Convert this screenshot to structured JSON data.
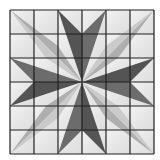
{
  "figure": {
    "grid": {
      "rows": 6,
      "cols": 6,
      "origin": [
        10,
        10
      ],
      "cell_size": 24
    },
    "colors": {
      "background": "#ffffff",
      "cell_fill": "#e6e6e6",
      "cell_fill_light": "#f0f0f0",
      "grid_line": "#202020",
      "cardinal_dark": "#545454",
      "cardinal_mid": "#6c6c6c",
      "diagonal_mid": "#a4a4a4",
      "diagonal_light": "#c6c6c6"
    },
    "cardinal_arms": [
      {
        "name": "top",
        "a": [
          [
            58,
            10
          ],
          [
            82,
            34
          ],
          [
            82,
            82
          ]
        ],
        "b": [
          [
            106,
            10
          ],
          [
            82,
            34
          ],
          [
            82,
            82
          ]
        ]
      },
      {
        "name": "right",
        "a": [
          [
            154,
            58
          ],
          [
            130,
            82
          ],
          [
            82,
            82
          ]
        ],
        "b": [
          [
            154,
            106
          ],
          [
            130,
            82
          ],
          [
            82,
            82
          ]
        ]
      },
      {
        "name": "bottom",
        "a": [
          [
            106,
            154
          ],
          [
            82,
            130
          ],
          [
            82,
            82
          ]
        ],
        "b": [
          [
            58,
            154
          ],
          [
            82,
            130
          ],
          [
            82,
            82
          ]
        ]
      },
      {
        "name": "left",
        "a": [
          [
            10,
            106
          ],
          [
            34,
            82
          ],
          [
            82,
            82
          ]
        ],
        "b": [
          [
            10,
            58
          ],
          [
            34,
            82
          ],
          [
            82,
            82
          ]
        ]
      }
    ],
    "diagonal_arms": [
      {
        "name": "top-left",
        "a": [
          [
            10,
            10
          ],
          [
            58,
            46
          ],
          [
            82,
            82
          ]
        ],
        "b": [
          [
            10,
            10
          ],
          [
            46,
            58
          ],
          [
            82,
            82
          ]
        ]
      },
      {
        "name": "top-right",
        "a": [
          [
            154,
            10
          ],
          [
            118,
            58
          ],
          [
            82,
            82
          ]
        ],
        "b": [
          [
            154,
            10
          ],
          [
            106,
            46
          ],
          [
            82,
            82
          ]
        ]
      },
      {
        "name": "bottom-right",
        "a": [
          [
            154,
            154
          ],
          [
            106,
            118
          ],
          [
            82,
            82
          ]
        ],
        "b": [
          [
            154,
            154
          ],
          [
            118,
            106
          ],
          [
            82,
            82
          ]
        ]
      },
      {
        "name": "bottom-left",
        "a": [
          [
            10,
            154
          ],
          [
            46,
            106
          ],
          [
            82,
            82
          ]
        ],
        "b": [
          [
            10,
            154
          ],
          [
            58,
            118
          ],
          [
            82,
            82
          ]
        ]
      }
    ]
  }
}
